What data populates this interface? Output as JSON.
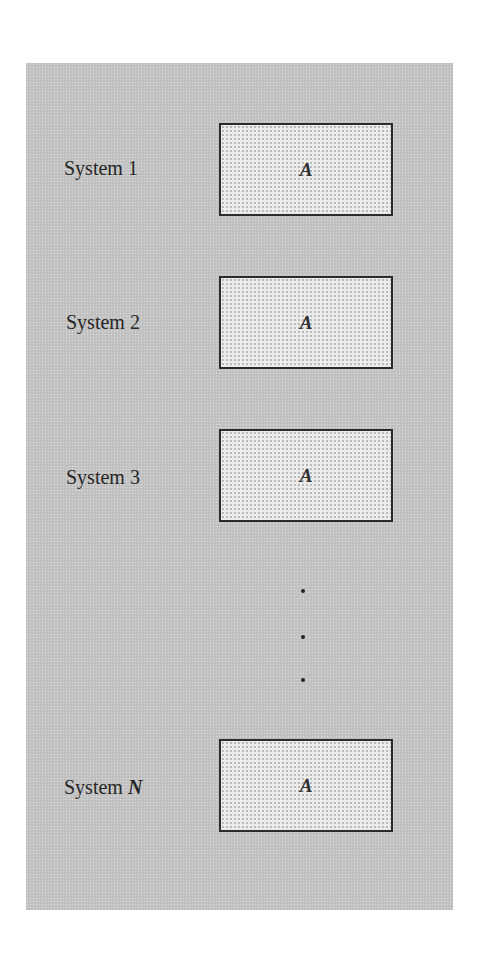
{
  "diagram": {
    "title": "",
    "systems": [
      {
        "label": "System 1",
        "box_label": "A"
      },
      {
        "label": "System 2",
        "box_label": "A"
      },
      {
        "label": "System 3",
        "box_label": "A"
      },
      {
        "label_prefix": "System",
        "label_var": "N",
        "box_label": "A"
      }
    ],
    "ellipsis": "⋮",
    "colors": {
      "panel_background": "#c4c4c4",
      "box_fill": "#ebebeb",
      "box_border": "#2b2b2b",
      "text": "#262626"
    }
  }
}
